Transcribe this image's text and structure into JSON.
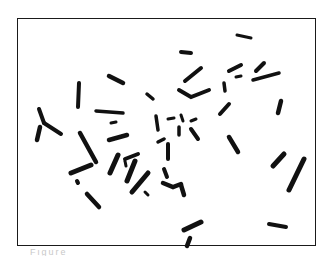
{
  "figure": {
    "type": "karyotype micrograph (metaphase chromosome spread)",
    "caption_partial": "Figure",
    "frame_color": "#1a1a1a",
    "chromosome_color": "#111111",
    "background_color": "#ffffff"
  }
}
